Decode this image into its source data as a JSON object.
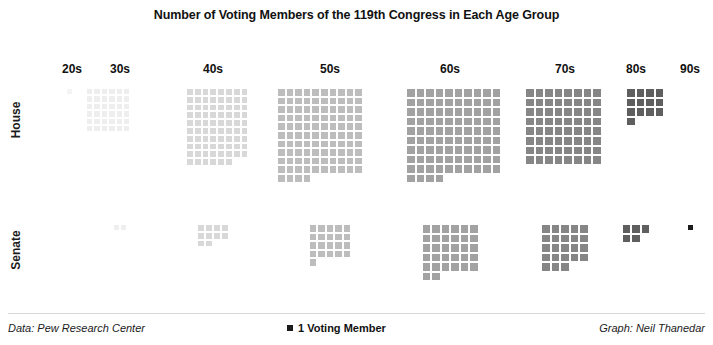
{
  "title": "Number of Voting Members of the 119th Congress in Each Age Group",
  "row_labels": {
    "house": "House",
    "senate": "Senate"
  },
  "footer": {
    "data_credit": "Data: Pew Research Center",
    "legend_label": "1 Voting Member",
    "graph_credit": "Graph: Neil Thanedar"
  },
  "chart_data": {
    "type": "bar",
    "subtype": "waffle-unit-chart",
    "title": "Number of Voting Members of the 119th Congress in Each Age Group",
    "xlabel": "",
    "ylabel": "",
    "unit": "1 Voting Member",
    "categories": [
      "20s",
      "30s",
      "40s",
      "50s",
      "60s",
      "70s",
      "80s",
      "90s"
    ],
    "series": [
      {
        "name": "House",
        "values": [
          1,
          36,
          78,
          104,
          94,
          64,
          13,
          0
        ]
      },
      {
        "name": "Senate",
        "values": [
          0,
          2,
          10,
          21,
          32,
          23,
          5,
          1
        ]
      }
    ],
    "category_colors": {
      "20s": "#f4f4f4",
      "30s": "#eeeeee",
      "40s": "#d8d8d8",
      "50s": "#bdbdbd",
      "60s": "#a2a2a2",
      "70s": "#868686",
      "80s": "#5f5f5f",
      "90s": "#1b1b1b"
    },
    "legend_position": "bottom-center",
    "grid": false,
    "annotations": [
      "Data: Pew Research Center",
      "Graph: Neil Thanedar"
    ]
  },
  "layout": {
    "columns": [
      {
        "label": "20s",
        "center_x": 72,
        "block_x": 66,
        "cols": 1,
        "cell": 7.2
      },
      {
        "label": "30s",
        "center_x": 120,
        "block_x": 86,
        "cols": 6,
        "cell": 7.4
      },
      {
        "label": "40s",
        "center_x": 213,
        "block_x": 186,
        "cols": 8,
        "cell": 7.8
      },
      {
        "label": "50s",
        "center_x": 330,
        "block_x": 277,
        "cols": 10,
        "cell": 8.6
      },
      {
        "label": "60s",
        "center_x": 450,
        "block_x": 406,
        "cols": 10,
        "cell": 9.5
      },
      {
        "label": "70s",
        "center_x": 565,
        "block_x": 525,
        "cols": 8,
        "cell": 9.6
      },
      {
        "label": "80s",
        "center_x": 636,
        "block_x": 626,
        "cols": 4,
        "cell": 9.6
      },
      {
        "label": "90s",
        "center_x": 690,
        "block_x": 686,
        "cols": 1,
        "cell": 7.0
      }
    ],
    "rows": [
      {
        "key": "house",
        "top": 88
      },
      {
        "key": "senate",
        "top": 224
      }
    ],
    "senate_cols": [
      1,
      2,
      4,
      5,
      6,
      5,
      3,
      1
    ],
    "senate_cell": [
      7.2,
      7.4,
      7.8,
      8.6,
      9.5,
      9.6,
      9.6,
      7.0
    ]
  }
}
